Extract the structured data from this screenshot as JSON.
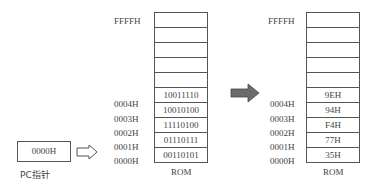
{
  "left_memory": {
    "top_address": "FFFFH",
    "rows": [
      {
        "address": "",
        "value": ""
      },
      {
        "address": "",
        "value": ""
      },
      {
        "address": "",
        "value": ""
      },
      {
        "address": "",
        "value": ""
      },
      {
        "address": "",
        "value": ""
      },
      {
        "address": "0004H",
        "value": "10011110"
      },
      {
        "address": "0003H",
        "value": "10010100"
      },
      {
        "address": "0002H",
        "value": "11110100"
      },
      {
        "address": "0001H",
        "value": "01110111"
      },
      {
        "address": "0000H",
        "value": "00110101"
      }
    ],
    "label": "ROM"
  },
  "right_memory": {
    "top_address": "FFFFH",
    "rows": [
      {
        "address": "",
        "value": ""
      },
      {
        "address": "",
        "value": ""
      },
      {
        "address": "",
        "value": ""
      },
      {
        "address": "",
        "value": ""
      },
      {
        "address": "",
        "value": ""
      },
      {
        "address": "0004H",
        "value": "9EH"
      },
      {
        "address": "0003H",
        "value": "94H"
      },
      {
        "address": "0002H",
        "value": "F4H"
      },
      {
        "address": "0001H",
        "value": "77H"
      },
      {
        "address": "0000H",
        "value": "35H"
      }
    ],
    "label": "ROM"
  },
  "pc": {
    "value": "0000H",
    "label": "PC指针"
  },
  "colors": {
    "line": "#555555",
    "arrow_fill": "#6b6b6b",
    "text": "#444444"
  }
}
